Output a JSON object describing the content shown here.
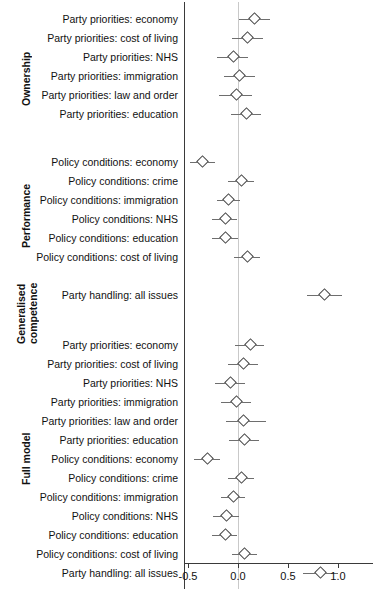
{
  "chart_data": {
    "type": "scatter",
    "title": "",
    "xlabel": "",
    "ylabel": "",
    "xlim": [
      -0.62,
      1.33
    ],
    "grid": false,
    "legend": null,
    "reference_line": 0.0,
    "xticks": [
      -0.5,
      0.0,
      0.5,
      1.0
    ],
    "xticklabels": [
      "-0.5",
      "0.0",
      "0.5",
      "1.0"
    ],
    "point_marker": "open diamond",
    "groups": [
      {
        "name": "Ownership",
        "rows": [
          {
            "label": "Party priorities: economy",
            "estimate": 0.16,
            "low": 0.01,
            "high": 0.32
          },
          {
            "label": "Party priorities: cost of living",
            "estimate": 0.09,
            "low": -0.06,
            "high": 0.25
          },
          {
            "label": "Party priorities: NHS",
            "estimate": -0.05,
            "low": -0.21,
            "high": 0.1
          },
          {
            "label": "Party priorities: immigration",
            "estimate": 0.01,
            "low": -0.14,
            "high": 0.17
          },
          {
            "label": "Party priorities: law and order",
            "estimate": -0.02,
            "low": -0.19,
            "high": 0.14
          },
          {
            "label": "Party priorities: education",
            "estimate": 0.08,
            "low": -0.07,
            "high": 0.23
          }
        ]
      },
      {
        "name": "Performance",
        "rows": [
          {
            "label": "Policy conditions: economy",
            "estimate": -0.36,
            "low": -0.48,
            "high": -0.23
          },
          {
            "label": "Policy conditions: crime",
            "estimate": 0.03,
            "low": -0.1,
            "high": 0.16
          },
          {
            "label": "Policy conditions: immigration",
            "estimate": -0.1,
            "low": -0.21,
            "high": 0.02
          },
          {
            "label": "Policy conditions: NHS",
            "estimate": -0.13,
            "low": -0.26,
            "high": -0.01
          },
          {
            "label": "Policy conditions: education",
            "estimate": -0.13,
            "low": -0.26,
            "high": 0.0
          },
          {
            "label": "Policy conditions: cost of living",
            "estimate": 0.09,
            "low": -0.04,
            "high": 0.22
          }
        ]
      },
      {
        "name": "Generalised\ncompetence",
        "rows": [
          {
            "label": "Party handling: all issues",
            "estimate": 0.86,
            "low": 0.69,
            "high": 1.04
          }
        ]
      },
      {
        "name": "Full model",
        "rows": [
          {
            "label": "Party priorities: economy",
            "estimate": 0.12,
            "low": -0.03,
            "high": 0.26
          },
          {
            "label": "Party priorities: cost of living",
            "estimate": 0.05,
            "low": -0.1,
            "high": 0.2
          },
          {
            "label": "Party priorities: NHS",
            "estimate": -0.08,
            "low": -0.23,
            "high": 0.07
          },
          {
            "label": "Party priorities: immigration",
            "estimate": -0.02,
            "low": -0.17,
            "high": 0.13
          },
          {
            "label": "Party priorities: law and order",
            "estimate": 0.05,
            "low": -0.12,
            "high": 0.28
          },
          {
            "label": "Party priorities: education",
            "estimate": 0.06,
            "low": -0.09,
            "high": 0.21
          },
          {
            "label": "Policy conditions: economy",
            "estimate": -0.31,
            "low": -0.44,
            "high": -0.18
          },
          {
            "label": "Policy conditions: crime",
            "estimate": 0.03,
            "low": -0.1,
            "high": 0.16
          },
          {
            "label": "Policy conditions: immigration",
            "estimate": -0.05,
            "low": -0.17,
            "high": 0.07
          },
          {
            "label": "Policy conditions: NHS",
            "estimate": -0.12,
            "low": -0.25,
            "high": 0.01
          },
          {
            "label": "Policy conditions: education",
            "estimate": -0.13,
            "low": -0.26,
            "high": -0.01
          },
          {
            "label": "Policy conditions: cost of living",
            "estimate": 0.06,
            "low": -0.06,
            "high": 0.19
          },
          {
            "label": "Party handling: all issues",
            "estimate": 0.82,
            "low": 0.65,
            "high": 1.0
          }
        ]
      }
    ]
  },
  "colors": {
    "point_edge": "#444444",
    "point_fill": "#ffffff",
    "error_bar": "#6e6e6e",
    "axis": "#3a3a3a",
    "zero_line": "#c9c9c9",
    "text": "#111111",
    "background": "#ffffff"
  },
  "layout": {
    "plot_left_px": 184,
    "plot_right_px": 373,
    "axis_y_px": 563,
    "row_height_px": 19,
    "px_per_unit": 100,
    "zero_x_px": 238
  }
}
